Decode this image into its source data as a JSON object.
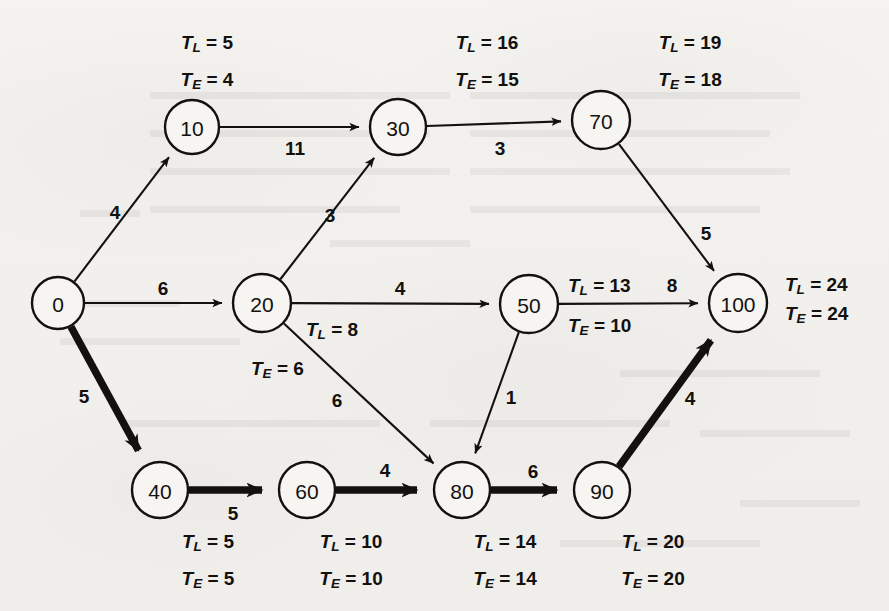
{
  "diagram": {
    "type": "pert-cpm-network",
    "background_color": "#f2f1ee",
    "ink_color": "#13110f",
    "critical_path_nodes": [
      "0",
      "40",
      "60",
      "80",
      "90",
      "100"
    ],
    "nodes": [
      {
        "id": "0",
        "label": "0",
        "cx": 58,
        "cy": 303,
        "r": 26,
        "TL": null,
        "TE": null,
        "TL_text": "",
        "TE_text": "",
        "label_pos": "none"
      },
      {
        "id": "10",
        "label": "10",
        "cx": 192,
        "cy": 127,
        "r": 27,
        "TL": 5,
        "TE": 4,
        "TL_text": "T L  = 5",
        "TE_text": "T E  = 4",
        "label_pos": "above"
      },
      {
        "id": "20",
        "label": "20",
        "cx": 262,
        "cy": 303,
        "r": 29,
        "TL": 8,
        "TE": 6,
        "TL_text": "T L  = 8",
        "TE_text": "T E  = 6",
        "label_pos": "below-right"
      },
      {
        "id": "30",
        "label": "30",
        "cx": 398,
        "cy": 127,
        "r": 28,
        "TL": 16,
        "TE": 15,
        "TL_text": "T L  = 16",
        "TE_text": "T E  = 15",
        "label_pos": "above"
      },
      {
        "id": "40",
        "label": "40",
        "cx": 160,
        "cy": 490,
        "r": 28,
        "TL": 5,
        "TE": 5,
        "TL_text": "T L  = 5",
        "TE_text": "T E  = 5",
        "label_pos": "below"
      },
      {
        "id": "50",
        "label": "50",
        "cx": 529,
        "cy": 304,
        "r": 29,
        "TL": 13,
        "TE": 10,
        "TL_text": "T L  = 13",
        "TE_text": "T E  = 10",
        "label_pos": "right-split"
      },
      {
        "id": "60",
        "label": "60",
        "cx": 307,
        "cy": 490,
        "r": 28,
        "TL": 10,
        "TE": 10,
        "TL_text": "T L  = 10",
        "TE_text": "T E  = 10",
        "label_pos": "below"
      },
      {
        "id": "70",
        "label": "70",
        "cx": 601,
        "cy": 120,
        "r": 29,
        "TL": 19,
        "TE": 18,
        "TL_text": "T L  = 19",
        "TE_text": "T E  = 18",
        "label_pos": "above"
      },
      {
        "id": "80",
        "label": "80",
        "cx": 462,
        "cy": 490,
        "r": 28,
        "TL": 14,
        "TE": 14,
        "TL_text": "T L  = 14",
        "TE_text": "T E  = 14",
        "label_pos": "below"
      },
      {
        "id": "90",
        "label": "90",
        "cx": 602,
        "cy": 490,
        "r": 28,
        "TL": 20,
        "TE": 20,
        "TL_text": "T L  = 20",
        "TE_text": "T E  = 20",
        "label_pos": "below"
      },
      {
        "id": "100",
        "label": "100",
        "cx": 738,
        "cy": 303,
        "r": 29,
        "TL": 24,
        "TE": 24,
        "TL_text": "T L  = 24",
        "TE_text": "T E  = 24",
        "label_pos": "right"
      }
    ],
    "edges": [
      {
        "from": "0",
        "to": "10",
        "weight": 4,
        "weight_label": "4",
        "critical": false,
        "label_x": 115,
        "label_y": 212
      },
      {
        "from": "0",
        "to": "20",
        "weight": 6,
        "weight_label": "6",
        "critical": false,
        "label_x": 163,
        "label_y": 288
      },
      {
        "from": "0",
        "to": "40",
        "weight": 5,
        "weight_label": "5",
        "critical": true,
        "label_x": 84,
        "label_y": 396
      },
      {
        "from": "10",
        "to": "30",
        "weight": 11,
        "weight_label": "11",
        "critical": false,
        "label_x": 295,
        "label_y": 148
      },
      {
        "from": "20",
        "to": "30",
        "weight": 3,
        "weight_label": "3",
        "critical": false,
        "label_x": 330,
        "label_y": 215
      },
      {
        "from": "20",
        "to": "50",
        "weight": 4,
        "weight_label": "4",
        "critical": false,
        "label_x": 400,
        "label_y": 288
      },
      {
        "from": "20",
        "to": "80",
        "weight": 6,
        "weight_label": "6",
        "critical": false,
        "label_x": 337,
        "label_y": 400
      },
      {
        "from": "30",
        "to": "70",
        "weight": 3,
        "weight_label": "3",
        "critical": false,
        "label_x": 500,
        "label_y": 148
      },
      {
        "from": "40",
        "to": "60",
        "weight": 5,
        "weight_label": "5",
        "critical": true,
        "label_x": 233,
        "label_y": 513
      },
      {
        "from": "50",
        "to": "80",
        "weight": 1,
        "weight_label": "1",
        "critical": false,
        "label_x": 511,
        "label_y": 397
      },
      {
        "from": "50",
        "to": "100",
        "weight": 8,
        "weight_label": "8",
        "critical": false,
        "label_x": 672,
        "label_y": 285
      },
      {
        "from": "60",
        "to": "80",
        "weight": 4,
        "weight_label": "4",
        "critical": true,
        "label_x": 385,
        "label_y": 470
      },
      {
        "from": "70",
        "to": "100",
        "weight": 5,
        "weight_label": "5",
        "critical": false,
        "label_x": 706,
        "label_y": 233
      },
      {
        "from": "80",
        "to": "90",
        "weight": 6,
        "weight_label": "6",
        "critical": true,
        "label_x": 533,
        "label_y": 471
      },
      {
        "from": "90",
        "to": "100",
        "weight": 4,
        "weight_label": "4",
        "critical": true,
        "label_x": 690,
        "label_y": 398
      }
    ],
    "time_labels": [
      {
        "node": "10",
        "kind": "TL",
        "var": "T",
        "sub": "L",
        "eq": " = ",
        "value": "5",
        "x": 207,
        "y": 42,
        "anchor": "middle"
      },
      {
        "node": "10",
        "kind": "TE",
        "var": "T",
        "sub": "E",
        "eq": " = ",
        "value": "4",
        "x": 207,
        "y": 79,
        "anchor": "middle"
      },
      {
        "node": "30",
        "kind": "TL",
        "var": "T",
        "sub": "L",
        "eq": " = ",
        "value": "16",
        "x": 487,
        "y": 42,
        "anchor": "middle"
      },
      {
        "node": "30",
        "kind": "TE",
        "var": "T",
        "sub": "E",
        "eq": " = ",
        "value": "15",
        "x": 487,
        "y": 79,
        "anchor": "middle"
      },
      {
        "node": "70",
        "kind": "TL",
        "var": "T",
        "sub": "L",
        "eq": " = ",
        "value": "19",
        "x": 690,
        "y": 42,
        "anchor": "middle"
      },
      {
        "node": "70",
        "kind": "TE",
        "var": "T",
        "sub": "E",
        "eq": " = ",
        "value": "18",
        "x": 690,
        "y": 79,
        "anchor": "middle"
      },
      {
        "node": "20",
        "kind": "TL",
        "var": "T",
        "sub": "L",
        "eq": " = ",
        "value": "8",
        "x": 306,
        "y": 329,
        "anchor": "start"
      },
      {
        "node": "20",
        "kind": "TE",
        "var": "T",
        "sub": "E",
        "eq": " = ",
        "value": "6",
        "x": 251,
        "y": 368,
        "anchor": "start"
      },
      {
        "node": "50",
        "kind": "TL",
        "var": "T",
        "sub": "L",
        "eq": " = ",
        "value": "13",
        "x": 568,
        "y": 285,
        "anchor": "start"
      },
      {
        "node": "50",
        "kind": "TE",
        "var": "T",
        "sub": "E",
        "eq": " = ",
        "value": "10",
        "x": 568,
        "y": 325,
        "anchor": "start"
      },
      {
        "node": "100",
        "kind": "TL",
        "var": "T",
        "sub": "L",
        "eq": " = ",
        "value": "24",
        "x": 785,
        "y": 284,
        "anchor": "start"
      },
      {
        "node": "100",
        "kind": "TE",
        "var": "T",
        "sub": "E",
        "eq": " = ",
        "value": "24",
        "x": 785,
        "y": 313,
        "anchor": "start"
      },
      {
        "node": "40",
        "kind": "TL",
        "var": "T",
        "sub": "L",
        "eq": " = ",
        "value": "5",
        "x": 208,
        "y": 541,
        "anchor": "middle"
      },
      {
        "node": "40",
        "kind": "TE",
        "var": "T",
        "sub": "E",
        "eq": " = ",
        "value": "5",
        "x": 208,
        "y": 578,
        "anchor": "middle"
      },
      {
        "node": "60",
        "kind": "TL",
        "var": "T",
        "sub": "L",
        "eq": " = ",
        "value": "10",
        "x": 351,
        "y": 541,
        "anchor": "middle"
      },
      {
        "node": "60",
        "kind": "TE",
        "var": "T",
        "sub": "E",
        "eq": " = ",
        "value": "10",
        "x": 351,
        "y": 578,
        "anchor": "middle"
      },
      {
        "node": "80",
        "kind": "TL",
        "var": "T",
        "sub": "L",
        "eq": " = ",
        "value": "14",
        "x": 505,
        "y": 541,
        "anchor": "middle"
      },
      {
        "node": "80",
        "kind": "TE",
        "var": "T",
        "sub": "E",
        "eq": " = ",
        "value": "14",
        "x": 505,
        "y": 578,
        "anchor": "middle"
      },
      {
        "node": "90",
        "kind": "TL",
        "var": "T",
        "sub": "L",
        "eq": " = ",
        "value": "20",
        "x": 653,
        "y": 541,
        "anchor": "middle"
      },
      {
        "node": "90",
        "kind": "TE",
        "var": "T",
        "sub": "E",
        "eq": " = ",
        "value": "20",
        "x": 653,
        "y": 578,
        "anchor": "middle"
      }
    ]
  }
}
